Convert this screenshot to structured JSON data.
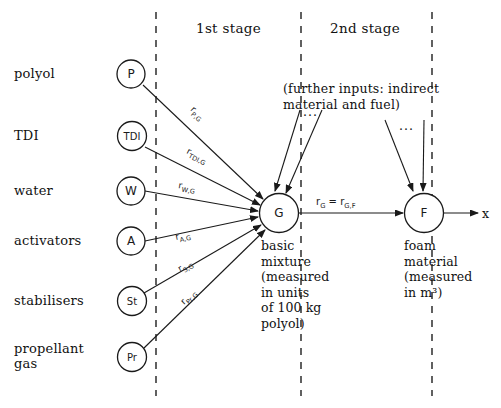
{
  "diagram": {
    "title_stages": [
      {
        "id": "stage1",
        "label": "1st stage"
      },
      {
        "id": "stage2",
        "label": "2nd stage"
      }
    ],
    "input_rows": [
      {
        "id": "polyol",
        "label": "polyol",
        "node": "P"
      },
      {
        "id": "tdi",
        "label": "TDI",
        "node": "TDI"
      },
      {
        "id": "water",
        "label": "water",
        "node": "W"
      },
      {
        "id": "activators",
        "label": "activators",
        "node": "A"
      },
      {
        "id": "stabilisers",
        "label": "stabilisers",
        "node": "St"
      },
      {
        "id": "propellant",
        "label": "propellant\ngas",
        "node": "Pr"
      }
    ],
    "rate_labels": [
      {
        "id": "r-p-g",
        "base": "r",
        "sub": "P,G"
      },
      {
        "id": "r-tdi-g",
        "base": "r",
        "sub": "TDI,G"
      },
      {
        "id": "r-w-g",
        "base": "r",
        "sub": "W,G"
      },
      {
        "id": "r-a-g",
        "base": "r",
        "sub": "A,G"
      },
      {
        "id": "r-s-g",
        "base": "r",
        "sub": "S,G"
      },
      {
        "id": "r-pr-g",
        "base": "r",
        "sub": "Pr,G"
      }
    ],
    "main_rate": {
      "id": "r-g-gf",
      "text_html": "r<sub>G</sub> = r<sub>G,F</sub>",
      "plain": "rG = rG,F"
    },
    "further_inputs_note": "(further inputs: indirect\nmaterial and fuel)",
    "ellipsis_marks": [
      {
        "id": "ellipsis-g",
        "text": "..."
      },
      {
        "id": "ellipsis-f",
        "text": "..."
      }
    ],
    "process_nodes": [
      {
        "id": "g-node",
        "letter": "G",
        "caption": "basic\nmixture\n(measured\nin units\nof 100 kg\npolyol)"
      },
      {
        "id": "f-node",
        "letter": "F",
        "caption": "foam\nmaterial\n(measured\nin m³)"
      }
    ],
    "output_axis_label": "x",
    "colors": {
      "ink": "#1a1a1a",
      "paper": "#ffffff",
      "dash": "#3a3a3a"
    }
  }
}
